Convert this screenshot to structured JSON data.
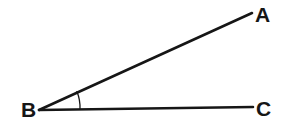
{
  "figure": {
    "kind": "geometry-angle-diagram",
    "canvas": {
      "width": 285,
      "height": 134,
      "background": "#ffffff"
    },
    "stroke_color": "#161616",
    "label_color": "#161616",
    "ray_stroke_width": 2.6,
    "arc_stroke_width": 1.3,
    "vertices": {
      "A": {
        "label": "A",
        "x": 252,
        "y": 13
      },
      "B": {
        "label": "B",
        "x": 39,
        "y": 110
      },
      "C": {
        "label": "C",
        "x": 253,
        "y": 107
      }
    },
    "rays": [
      {
        "name": "ray-BA",
        "from": "B",
        "to": "A",
        "path": "M 39 110 L 252 13"
      },
      {
        "name": "ray-BC",
        "from": "B",
        "to": "C",
        "path": "M 39 110 L 253 107"
      }
    ],
    "angle_arc": {
      "name": "angle-arc-ABC",
      "vertex": "B",
      "radius": 42,
      "path": "M 80 109.4 A 42 42 0 0 0 76.9 91.6"
    },
    "labels": {
      "a": "A",
      "b": "B",
      "c": "C"
    }
  }
}
